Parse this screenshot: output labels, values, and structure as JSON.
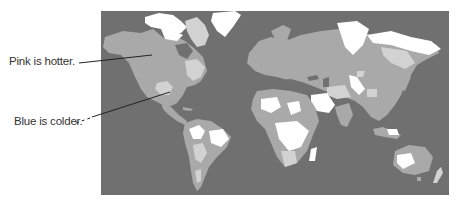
{
  "figure": {
    "type": "world temperature map",
    "annotations": [
      {
        "text": "Pink is hotter.",
        "target": "western North America (mid-tone region)"
      },
      {
        "text": "Blue is colder.",
        "target": "Mexico/southern US (light region)"
      }
    ]
  },
  "labels": {
    "hotter": "Pink is hotter.",
    "colder": "Blue is colder."
  },
  "colors": {
    "ocean": "#707070",
    "land_mid": "#a9a9a9",
    "land_light": "#d2d2d2",
    "land_white": "#ffffff",
    "leader_line": "#222222"
  }
}
